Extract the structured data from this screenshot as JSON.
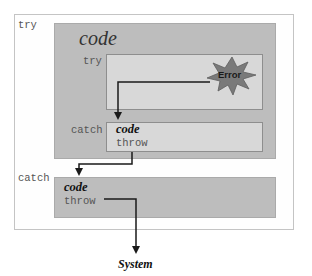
{
  "diagram": {
    "outer": {
      "label": "try",
      "code_label": "code"
    },
    "inner_try": {
      "label": "try"
    },
    "error": {
      "label": "Error",
      "color": "#7a7a7a"
    },
    "inner_catch": {
      "label": "catch",
      "code_label": "code",
      "throw_label": "throw"
    },
    "outer_catch": {
      "label": "catch",
      "code_label": "code",
      "throw_label": "throw"
    },
    "destination": {
      "label": "System"
    }
  }
}
